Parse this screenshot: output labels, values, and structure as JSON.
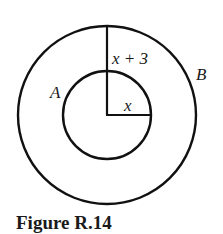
{
  "figure": {
    "caption": "Figure R.14",
    "labels": {
      "outer_radius": "x + 3",
      "inner_radius": "x",
      "inner_circle": "A",
      "outer_circle": "B"
    },
    "line_color": "#111111"
  }
}
